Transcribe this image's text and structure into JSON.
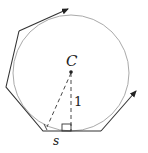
{
  "diagram": {
    "center_label": "C",
    "radius_label": "1",
    "side_label": "s",
    "colors": {
      "polygon": "#333333",
      "circle": "#aaaaaa",
      "dashed": "#333333"
    }
  }
}
